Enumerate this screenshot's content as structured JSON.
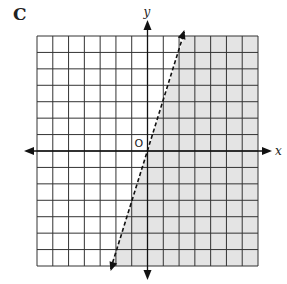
{
  "panel_label": "C",
  "chart_data": {
    "type": "inequality-graph",
    "title": "",
    "xlabel": "x",
    "ylabel": "y",
    "origin_label": "O",
    "xlim": [
      -7,
      7
    ],
    "ylim": [
      -7,
      7
    ],
    "grid": true,
    "grid_step": 1,
    "boundary_line": {
      "equation": "y = 3x",
      "slope": 3,
      "intercept": 0,
      "style": "dashed",
      "points": [
        [
          -2.33,
          -7
        ],
        [
          2.33,
          7
        ]
      ]
    },
    "shaded_region": "right of / below the line (y < 3x)",
    "colors": {
      "shade": "#e4e4e4",
      "grid": "#333333",
      "axes": "#111111",
      "line": "#111111"
    }
  }
}
